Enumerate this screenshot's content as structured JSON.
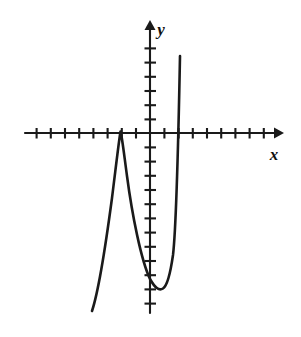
{
  "figure": {
    "kind": "coordinate-plane-graph",
    "background_color": "#ffffff",
    "ink_color": "#1a1a1a",
    "width": 301,
    "height": 337
  },
  "labels": {
    "x_axis": "x",
    "y_axis": "y"
  },
  "chart_data": {
    "type": "line",
    "title": "",
    "subtitle": "",
    "xlabel": "x",
    "ylabel": "y",
    "grid": false,
    "legend": "none",
    "curve_description": "Cubic polynomial with a double root (local maximum touching the x-axis) on the negative x side, a local minimum below the x-axis near the y-axis, and a single root on the positive x side",
    "axis_units_per_tick": 1,
    "xlim": [
      -9,
      9
    ],
    "ylim": [
      -13,
      8
    ],
    "x_ticks": [
      -9,
      -8,
      -7,
      -6,
      -5,
      -4,
      -3,
      -2,
      -1,
      1,
      2,
      3,
      4,
      5,
      6,
      7,
      8
    ],
    "y_ticks": [
      -13,
      -12,
      -11,
      -10,
      -9,
      -8,
      -7,
      -6,
      -5,
      -4,
      -3,
      -2,
      -1,
      1,
      2,
      3,
      4,
      5,
      6,
      7
    ],
    "x_axis_arrow": "right",
    "y_axis_arrow": "up",
    "roots": [
      -2,
      2
    ],
    "local_maximum": {
      "x": -2,
      "y": 0
    },
    "local_minimum": {
      "x": 0.9,
      "y": -11
    },
    "y_intercept": -9.5,
    "series": [
      {
        "name": "cubic",
        "x": [
          -4.1,
          -3.8,
          -3.5,
          -3.2,
          -3.0,
          -2.8,
          -2.6,
          -2.4,
          -2.2,
          -2.0,
          -1.8,
          -1.6,
          -1.4,
          -1.2,
          -1.0,
          -0.8,
          -0.6,
          -0.4,
          -0.2,
          0.0,
          0.2,
          0.4,
          0.6,
          0.8,
          1.0,
          1.2,
          1.4,
          1.6,
          1.8,
          2.0,
          2.2,
          2.3
        ],
        "y": [
          -12.6,
          -10.2,
          -7.8,
          -5.3,
          -3.6,
          -2.2,
          -1.1,
          -0.4,
          -0.05,
          0.0,
          -0.3,
          -0.9,
          -1.8,
          -2.9,
          -4.2,
          -5.6,
          -7.0,
          -8.3,
          -9.2,
          -9.8,
          -10.5,
          -10.9,
          -11.1,
          -11.15,
          -11.0,
          -10.4,
          -9.2,
          -7.2,
          -4.2,
          0.2,
          5.1,
          7.0
        ]
      }
    ]
  },
  "curve_path": "M 92 311 C 99 290 106 243 112 198 C 116 166 119 140 120.5 131.5 C 122 136 124 154 127 176 C 132 214 141 260 150 279 C 155 288 159 291 163 288.5 C 167 286 170 276 173 255 C 176 230 178 160 180 56",
  "geometry": {
    "x_axis_y": 133,
    "y_axis_x": 150,
    "x_axis_start": 25,
    "x_axis_end": 281,
    "y_axis_top": 22,
    "y_axis_bottom": 313,
    "tick_spacing": 14.2,
    "tick_half_length": 5,
    "x_label_pos": {
      "x": 274,
      "y": 160
    },
    "y_label_pos": {
      "x": 161,
      "y": 35
    }
  }
}
